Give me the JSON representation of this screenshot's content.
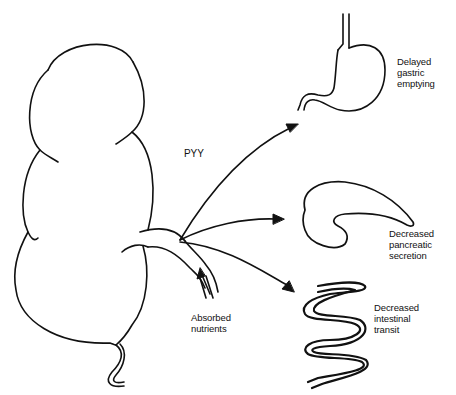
{
  "diagram": {
    "type": "physiology-schematic",
    "hormone_label": "PYY",
    "source": {
      "organ": "colon",
      "stimulus_lines": [
        "Absorbed",
        "nutrients"
      ]
    },
    "effects": [
      {
        "target": "stomach",
        "lines": [
          "Delayed",
          "gastric",
          "emptying"
        ]
      },
      {
        "target": "pancreas",
        "lines": [
          "Decreased",
          "pancreatic",
          "secretion"
        ]
      },
      {
        "target": "small-intestine",
        "lines": [
          "Decreased",
          "intestinal",
          "transit"
        ]
      }
    ],
    "colors": {
      "stroke": "#111111",
      "background": "#ffffff"
    }
  }
}
